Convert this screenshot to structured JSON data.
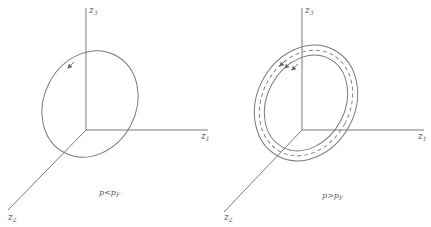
{
  "panels": [
    {
      "id": "left",
      "axes": {
        "z3": {
          "base": "z",
          "sub": "3"
        },
        "z1": {
          "base": "z",
          "sub": "1"
        },
        "z2": {
          "base": "z",
          "sub": "2"
        }
      },
      "caption": {
        "lhs": "p",
        "rel": "<",
        "rhs": "p",
        "rhs_sub": "F"
      },
      "orbit": "single closed ellipse with direction arrow"
    },
    {
      "id": "right",
      "axes": {
        "z3": {
          "base": "z",
          "sub": "3"
        },
        "z1": {
          "base": "z",
          "sub": "1"
        },
        "z2": {
          "base": "z",
          "sub": "2"
        }
      },
      "caption": {
        "lhs": "p",
        "rel": ">",
        "rhs": "p",
        "rhs_sub": "F"
      },
      "orbit": "band of two solid ellipses with dashed center ellipse and direction arrows"
    }
  ],
  "colors": {
    "line": "#6a6a6a",
    "text": "#555555",
    "background": "#ffffff"
  }
}
